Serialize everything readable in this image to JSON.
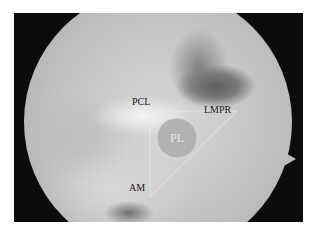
{
  "image": {
    "description": "Arthroscopic view of knee with triangular annotation",
    "labels": {
      "pcl": "PCL",
      "lmpr": "LMPR",
      "am": "AM",
      "pl": "PL"
    },
    "colors": {
      "frame": "#0c0c0c",
      "annotation_line": "#e6e6e6",
      "pl_circle_fill": "#a9a9a9"
    }
  }
}
